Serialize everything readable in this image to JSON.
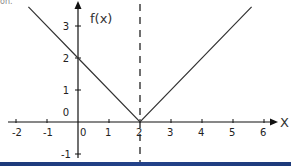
{
  "corner_text": "on.",
  "chart_data": {
    "type": "line",
    "title": "",
    "function": "f(x) = |x - 2|",
    "xlabel": "X",
    "ylabel": "f(x)",
    "xlim": [
      -2.2,
      6.4
    ],
    "ylim": [
      -1.2,
      3.7
    ],
    "x_ticks": [
      -2,
      -1,
      0,
      1,
      2,
      3,
      4,
      5,
      6
    ],
    "y_ticks": [
      -1,
      0,
      1,
      2,
      3
    ],
    "x_tick_labels": [
      "-2",
      "-1",
      "0",
      "1",
      "2",
      "3",
      "4",
      "5",
      "6"
    ],
    "y_tick_labels": [
      "-1",
      "0",
      "1",
      "2",
      "3"
    ],
    "series": [
      {
        "name": "f(x)",
        "x": [
          -1.6,
          0,
          2,
          5.6
        ],
        "y": [
          3.6,
          2,
          0,
          3.6
        ]
      }
    ],
    "annotations": [
      {
        "type": "vertical-dashed-line",
        "x": 2
      }
    ],
    "grid": false,
    "legend": null
  },
  "layout": {
    "origin_px": [
      78,
      122
    ],
    "x_unit_px": 31,
    "y_unit_px": 32,
    "line_color": "#333333",
    "axis_color": "#111111",
    "bar_color": "#1d3a7a"
  }
}
